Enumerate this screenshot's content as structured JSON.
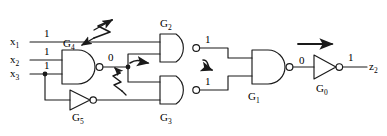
{
  "diagram": {
    "type": "digital-logic-schematic",
    "line_color": "#1a1a1a",
    "background": "#ffffff"
  },
  "inputs": [
    {
      "name": "x",
      "sub": "1",
      "value": "1"
    },
    {
      "name": "x",
      "sub": "2",
      "value": "1"
    },
    {
      "name": "x",
      "sub": "3",
      "value": "1"
    }
  ],
  "outputs": [
    {
      "name": "z",
      "sub": "2",
      "value": "1"
    }
  ],
  "gates": [
    {
      "id": "G4",
      "name": "G",
      "sub": "4",
      "type": "nand",
      "label_pos": "above",
      "output_value": "0"
    },
    {
      "id": "G5",
      "name": "G",
      "sub": "5",
      "type": "not",
      "label_pos": "below",
      "output_value": ""
    },
    {
      "id": "G2",
      "name": "G",
      "sub": "2",
      "type": "nand",
      "label_pos": "above",
      "output_value": "1"
    },
    {
      "id": "G3",
      "name": "G",
      "sub": "3",
      "type": "nand",
      "label_pos": "below",
      "output_value": "1"
    },
    {
      "id": "G1",
      "name": "G",
      "sub": "1",
      "type": "nand",
      "label_pos": "below",
      "output_value": "0"
    },
    {
      "id": "G0",
      "name": "G",
      "sub": "0",
      "type": "not",
      "label_pos": "below",
      "output_value": "1"
    }
  ],
  "annotations": {
    "fault_markers": [
      {
        "id": "fault-bolt-large",
        "shape": "lightning-double-arrow"
      },
      {
        "id": "fault-bolt-small",
        "shape": "lightning-arrow"
      }
    ],
    "propagation_arrows": [
      {
        "id": "prop-arrow-g4-out",
        "shape": "curved-arrow-right"
      },
      {
        "id": "prop-arrow-g2-out",
        "shape": "curved-arrow-right"
      },
      {
        "id": "prop-arrow-g0",
        "shape": "straight-arrow-right"
      }
    ]
  }
}
